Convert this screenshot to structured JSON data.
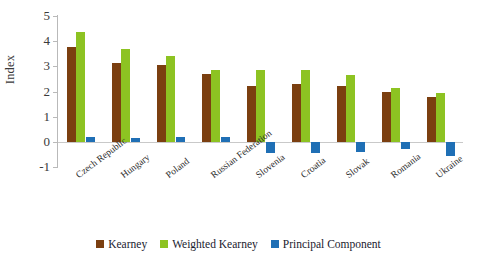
{
  "chart_data": {
    "type": "bar",
    "title": "",
    "xlabel": "",
    "ylabel": "Index",
    "ylim": [
      -1,
      5
    ],
    "yticks": [
      5,
      4,
      3,
      2,
      1,
      0,
      -1
    ],
    "grid": false,
    "legend_position": "bottom",
    "categories": [
      "Czech Republic",
      "Hungary",
      "Poland",
      "Russian Federation",
      "Slovenia",
      "Croatia",
      "Slovak",
      "Romania",
      "Ukraine"
    ],
    "series": [
      {
        "name": "Kearney",
        "color": "#7B3F10",
        "values": [
          3.75,
          3.15,
          3.05,
          2.7,
          2.2,
          2.3,
          2.2,
          2.0,
          1.8
        ]
      },
      {
        "name": "Weighted Kearney",
        "color": "#8DC322",
        "values": [
          4.35,
          3.7,
          3.4,
          2.85,
          2.85,
          2.85,
          2.65,
          2.15,
          1.95
        ]
      },
      {
        "name": "Principal Component",
        "color": "#1F6FB5",
        "values": [
          0.2,
          0.15,
          0.2,
          0.2,
          -0.45,
          -0.45,
          -0.4,
          -0.3,
          -0.55
        ]
      }
    ]
  },
  "legend": {
    "items": [
      {
        "label": "Kearney",
        "color": "#7B3F10"
      },
      {
        "label": "Weighted Kearney",
        "color": "#8DC322"
      },
      {
        "label": "Principal Component",
        "color": "#1F6FB5"
      }
    ]
  }
}
